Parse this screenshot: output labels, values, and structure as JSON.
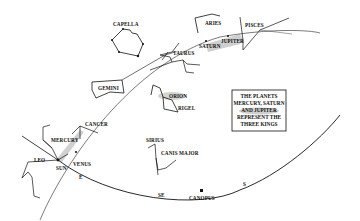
{
  "labels": {
    "capella": "CAPELLA",
    "aries": "ARIES",
    "pisces": "PISCES",
    "taurus": "TAURUS",
    "saturn": "SATURN",
    "jupiter": "JUPITER",
    "gemini": "GEMINI",
    "orion": "ORION",
    "rigel": "RIGEL",
    "cancer": "CANCER",
    "mercury": "MERCURY",
    "leo": "LEO",
    "sun": "SUN",
    "venus": "VENUS",
    "sirius": "SIRIUS",
    "canis_major": "CANIS MAJOR",
    "canopus": "CANOPUS",
    "dir_e": "E",
    "dir_se": "SE",
    "dir_s": "S"
  },
  "infobox": {
    "lines": [
      "THE PLANETS",
      "MERCURY, SATURN",
      "AND JUPITER",
      "REPRESENT THE",
      "THREE KINGS"
    ]
  },
  "colors": {
    "ink": "#111111",
    "highlight": "#c8c8c8",
    "background": "#ffffff"
  }
}
